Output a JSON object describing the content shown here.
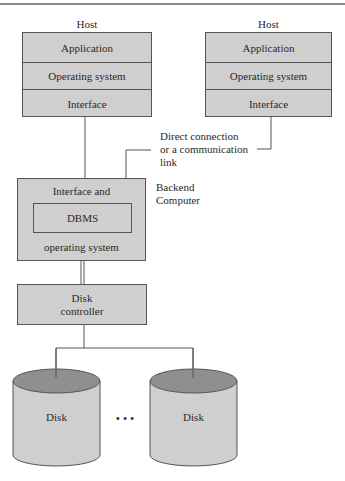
{
  "hosts": [
    {
      "title": "Host",
      "layers": [
        "Application",
        "Operating system",
        "Interface"
      ]
    },
    {
      "title": "Host",
      "layers": [
        "Application",
        "Operating system",
        "Interface"
      ]
    }
  ],
  "connection_label": [
    "Direct connection",
    "or a communication",
    "link"
  ],
  "backend": {
    "label": [
      "Backend",
      "Computer"
    ],
    "top_text": "Interface and",
    "inner": "DBMS",
    "bottom_text": "operating system"
  },
  "disk_controller": [
    "Disk",
    "controller"
  ],
  "disks": [
    "Disk",
    "Disk"
  ],
  "ellipsis": "• • •",
  "colors": {
    "box_fill": "#cfcfcf",
    "disk_top": "#8f8f8f",
    "line": "#555555"
  }
}
